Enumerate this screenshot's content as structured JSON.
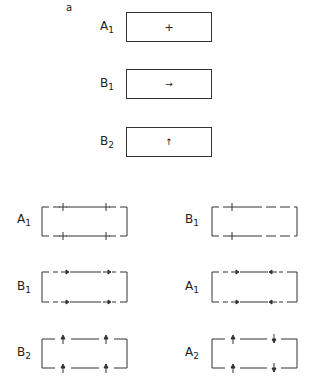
{
  "panel_label": "a",
  "top_column": {
    "items": [
      {
        "label": "A",
        "sub": "1",
        "symbol": "+",
        "symbol_name": "plus"
      },
      {
        "label": "B",
        "sub": "1",
        "symbol": "→",
        "symbol_name": "arrow-right"
      },
      {
        "label": "B",
        "sub": "2",
        "symbol": "↑",
        "symbol_name": "arrow-up"
      }
    ]
  },
  "grid": {
    "left": [
      {
        "label": "A",
        "sub": "1",
        "markers": [
          "plus",
          "plus"
        ]
      },
      {
        "label": "B",
        "sub": "1",
        "markers": [
          "arrow-right",
          "arrow-right"
        ]
      },
      {
        "label": "B",
        "sub": "2",
        "markers": [
          "arrow-up",
          "arrow-up"
        ]
      }
    ],
    "right": [
      {
        "label": "B",
        "sub": "1",
        "markers": [
          "plus"
        ]
      },
      {
        "label": "A",
        "sub": "1",
        "markers": [
          "arrow-right",
          "arrow-left"
        ]
      },
      {
        "label": "A",
        "sub": "2",
        "markers": [
          "arrow-up",
          "arrow-down"
        ]
      }
    ]
  },
  "colors": {
    "ink": "#333333",
    "background": "#ffffff"
  }
}
